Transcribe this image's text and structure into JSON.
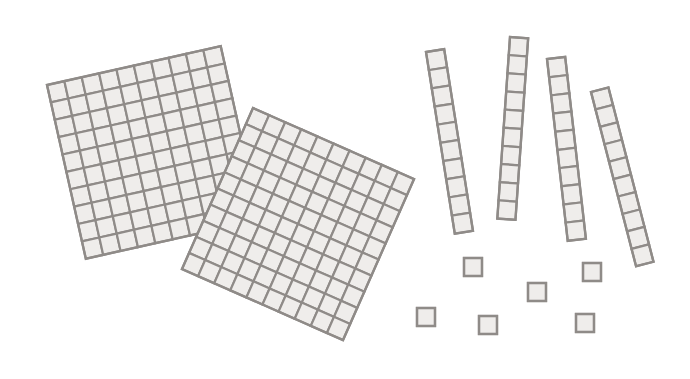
{
  "scene": {
    "title": "Base-ten blocks",
    "width": 690,
    "height": 379,
    "background": "#ffffff",
    "colors": {
      "fill": "#efedeb",
      "stroke": "#8f8b88"
    }
  },
  "blocks": {
    "flats": [
      {
        "name": "hundred-flat-1",
        "x": 47,
        "y": 85,
        "cols": 10,
        "rows": 10,
        "cell": 17.8,
        "angle": -12.6
      },
      {
        "name": "hundred-flat-2",
        "x": 253,
        "y": 108,
        "cols": 10,
        "rows": 10,
        "cell": 17.6,
        "angle": 23.8
      }
    ],
    "rods": [
      {
        "name": "ten-rod-1",
        "x": 426,
        "y": 52,
        "cols": 1,
        "rows": 10,
        "cell": 18.4,
        "angle": -9.0
      },
      {
        "name": "ten-rod-2",
        "x": 510,
        "y": 37,
        "cols": 1,
        "rows": 10,
        "cell": 18.2,
        "angle": 4.0
      },
      {
        "name": "ten-rod-3",
        "x": 547,
        "y": 59,
        "cols": 1,
        "rows": 10,
        "cell": 18.3,
        "angle": -6.5
      },
      {
        "name": "ten-rod-4",
        "x": 591,
        "y": 92,
        "cols": 1,
        "rows": 10,
        "cell": 18.0,
        "angle": -14.5
      }
    ],
    "units": [
      {
        "name": "unit-cube-1",
        "x": 464,
        "y": 258,
        "cols": 1,
        "rows": 1,
        "cell": 18,
        "angle": 0
      },
      {
        "name": "unit-cube-2",
        "x": 583,
        "y": 263,
        "cols": 1,
        "rows": 1,
        "cell": 18,
        "angle": 0
      },
      {
        "name": "unit-cube-3",
        "x": 528,
        "y": 283,
        "cols": 1,
        "rows": 1,
        "cell": 18,
        "angle": 0
      },
      {
        "name": "unit-cube-4",
        "x": 417,
        "y": 308,
        "cols": 1,
        "rows": 1,
        "cell": 18,
        "angle": 0
      },
      {
        "name": "unit-cube-5",
        "x": 479,
        "y": 316,
        "cols": 1,
        "rows": 1,
        "cell": 18,
        "angle": 0
      },
      {
        "name": "unit-cube-6",
        "x": 576,
        "y": 314,
        "cols": 1,
        "rows": 1,
        "cell": 18,
        "angle": 0
      }
    ]
  }
}
